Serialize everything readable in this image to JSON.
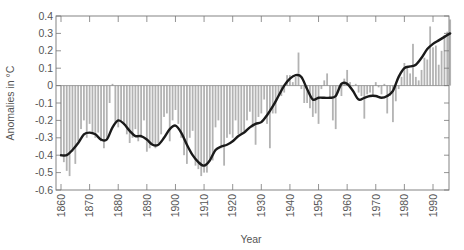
{
  "chart_data": {
    "type": "bar",
    "title": "",
    "xlabel": "Year",
    "ylabel": "Anomalies in °C",
    "xlim": [
      1860,
      1996
    ],
    "ylim": [
      -0.6,
      0.4
    ],
    "grid": false,
    "legend": "none",
    "x_ticks": [
      "1860",
      "1870",
      "1880",
      "1890",
      "1900",
      "1910",
      "1920",
      "1930",
      "1940",
      "1950",
      "1960",
      "1970",
      "1980",
      "1990"
    ],
    "x_tick_values": [
      1860,
      1870,
      1880,
      1890,
      1900,
      1910,
      1920,
      1930,
      1940,
      1950,
      1960,
      1970,
      1980,
      1990
    ],
    "y_ticks": [
      "0.4",
      "0.3",
      "0.2",
      "0.1",
      "0",
      "-0.1",
      "-0.2",
      "-0.3",
      "-0.4",
      "-0.5",
      "-0.6"
    ],
    "y_tick_values": [
      0.4,
      0.3,
      0.2,
      0.1,
      0,
      -0.1,
      -0.2,
      -0.3,
      -0.4,
      -0.5,
      -0.6
    ],
    "series": [
      {
        "name": "Annual anomaly",
        "kind": "bar",
        "color": "#b3b3b3",
        "x_start": 1860,
        "values": [
          -0.4,
          -0.44,
          -0.49,
          -0.52,
          -0.38,
          -0.45,
          -0.32,
          -0.25,
          -0.2,
          -0.3,
          -0.22,
          -0.28,
          -0.3,
          -0.27,
          -0.32,
          -0.36,
          -0.3,
          -0.1,
          0.01,
          -0.22,
          -0.24,
          -0.2,
          -0.22,
          -0.28,
          -0.33,
          -0.3,
          -0.25,
          -0.32,
          -0.3,
          -0.2,
          -0.38,
          -0.36,
          -0.34,
          -0.36,
          -0.33,
          -0.28,
          -0.18,
          -0.16,
          -0.32,
          -0.2,
          -0.14,
          -0.22,
          -0.3,
          -0.4,
          -0.45,
          -0.3,
          -0.26,
          -0.46,
          -0.48,
          -0.52,
          -0.5,
          -0.5,
          -0.42,
          -0.43,
          -0.24,
          -0.2,
          -0.36,
          -0.46,
          -0.3,
          -0.28,
          -0.3,
          -0.2,
          -0.28,
          -0.28,
          -0.26,
          -0.2,
          -0.15,
          -0.24,
          -0.34,
          -0.18,
          -0.16,
          -0.08,
          -0.22,
          -0.36,
          -0.16,
          -0.16,
          -0.06,
          -0.06,
          -0.04,
          0.06,
          0.06,
          0.02,
          0.05,
          0.19,
          -0.02,
          -0.1,
          -0.1,
          -0.13,
          -0.18,
          -0.16,
          -0.22,
          -0.02,
          0.03,
          0.07,
          -0.07,
          -0.2,
          -0.25,
          -0.02,
          -0.06,
          0.04,
          0.09,
          0.02,
          0.0,
          0.01,
          -0.04,
          -0.06,
          -0.19,
          -0.05,
          -0.04,
          -0.06,
          0.02,
          -0.01,
          -0.05,
          0.01,
          -0.16,
          -0.06,
          -0.21,
          -0.09,
          -0.02,
          0.05,
          0.13,
          0.1,
          0.07,
          0.24,
          0.05,
          0.03,
          0.09,
          0.16,
          0.15,
          0.34,
          0.22,
          0.23,
          0.12,
          0.2,
          0.29,
          0.31,
          0.38
        ]
      },
      {
        "name": "Smoothed trend",
        "kind": "line",
        "color": "#1a1a1a",
        "points": [
          [
            1860,
            -0.4
          ],
          [
            1862,
            -0.4
          ],
          [
            1864,
            -0.37
          ],
          [
            1866,
            -0.33
          ],
          [
            1868,
            -0.28
          ],
          [
            1870,
            -0.27
          ],
          [
            1872,
            -0.28
          ],
          [
            1874,
            -0.31
          ],
          [
            1876,
            -0.31
          ],
          [
            1878,
            -0.24
          ],
          [
            1880,
            -0.2
          ],
          [
            1882,
            -0.22
          ],
          [
            1884,
            -0.26
          ],
          [
            1886,
            -0.29
          ],
          [
            1888,
            -0.29
          ],
          [
            1890,
            -0.31
          ],
          [
            1892,
            -0.34
          ],
          [
            1894,
            -0.34
          ],
          [
            1896,
            -0.3
          ],
          [
            1898,
            -0.25
          ],
          [
            1900,
            -0.23
          ],
          [
            1902,
            -0.27
          ],
          [
            1904,
            -0.34
          ],
          [
            1906,
            -0.4
          ],
          [
            1908,
            -0.44
          ],
          [
            1910,
            -0.46
          ],
          [
            1912,
            -0.43
          ],
          [
            1914,
            -0.37
          ],
          [
            1916,
            -0.35
          ],
          [
            1918,
            -0.34
          ],
          [
            1920,
            -0.32
          ],
          [
            1922,
            -0.29
          ],
          [
            1924,
            -0.27
          ],
          [
            1926,
            -0.24
          ],
          [
            1928,
            -0.22
          ],
          [
            1930,
            -0.21
          ],
          [
            1932,
            -0.17
          ],
          [
            1934,
            -0.12
          ],
          [
            1936,
            -0.06
          ],
          [
            1938,
            0.0
          ],
          [
            1940,
            0.04
          ],
          [
            1942,
            0.06
          ],
          [
            1944,
            0.05
          ],
          [
            1946,
            -0.02
          ],
          [
            1948,
            -0.08
          ],
          [
            1950,
            -0.07
          ],
          [
            1952,
            -0.07
          ],
          [
            1954,
            -0.07
          ],
          [
            1956,
            -0.06
          ],
          [
            1958,
            0.01
          ],
          [
            1960,
            0.01
          ],
          [
            1962,
            -0.03
          ],
          [
            1964,
            -0.08
          ],
          [
            1966,
            -0.07
          ],
          [
            1968,
            -0.06
          ],
          [
            1970,
            -0.06
          ],
          [
            1972,
            -0.07
          ],
          [
            1974,
            -0.06
          ],
          [
            1976,
            -0.03
          ],
          [
            1978,
            0.05
          ],
          [
            1980,
            0.1
          ],
          [
            1982,
            0.11
          ],
          [
            1984,
            0.12
          ],
          [
            1986,
            0.16
          ],
          [
            1988,
            0.21
          ],
          [
            1990,
            0.24
          ],
          [
            1992,
            0.26
          ],
          [
            1994,
            0.28
          ],
          [
            1996,
            0.3
          ]
        ]
      }
    ]
  }
}
